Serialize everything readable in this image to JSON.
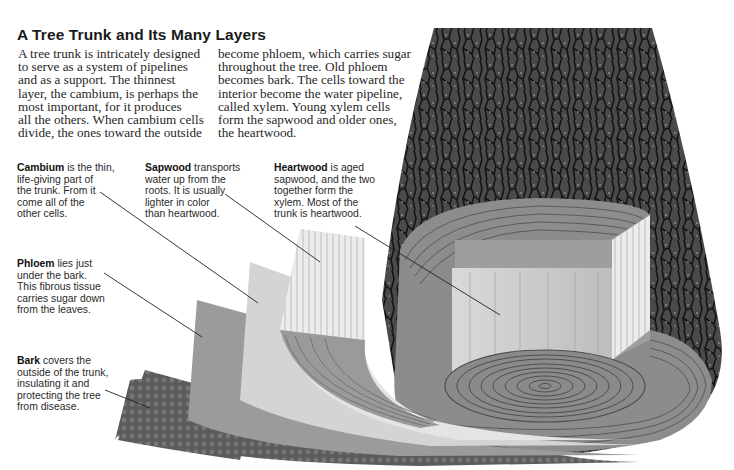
{
  "title": "A Tree Trunk and Its Many Layers",
  "intro": {
    "column1": [
      "A tree trunk is intricately designed",
      "to serve as a system of pipelines",
      "and as a support. The thinnest",
      "layer, the cambium, is perhaps the",
      "most important, for it produces",
      "all the others. When cambium cells",
      "divide, the ones toward the outside"
    ],
    "column2": [
      "become phloem, which carries sugar",
      "throughout the tree. Old phloem",
      "becomes bark. The cells toward the",
      "interior become the water pipeline,",
      "called xylem. Young xylem cells",
      "form the sapwood and older ones,",
      "the heartwood."
    ]
  },
  "labels": {
    "cambium": {
      "term": "Cambium",
      "lines": [
        " is the thin,",
        "life-giving part of",
        "the trunk. From it",
        "come all of the",
        "other cells."
      ]
    },
    "sapwood": {
      "term": "Sapwood",
      "lines": [
        " transports",
        "water up from the",
        "roots. It is usually",
        "lighter in color",
        "than heartwood."
      ]
    },
    "heartwood": {
      "term": "Heartwood",
      "lines": [
        " is aged",
        "sapwood, and the two",
        "together form the",
        "xylem. Most of the",
        "trunk is heartwood."
      ]
    },
    "phloem": {
      "term": "Phloem",
      "lines": [
        " lies just",
        "under the bark.",
        "This fibrous tissue",
        "carries sugar down",
        "from the leaves."
      ]
    },
    "bark": {
      "term": "Bark",
      "lines": [
        " covers the",
        "outside of the trunk,",
        "insulating it and",
        "protecting the tree",
        "from disease."
      ]
    }
  },
  "colors": {
    "bark_dark": "#3a3a3a",
    "bark_mid": "#6b6b6b",
    "phloem": "#9a9a9a",
    "cambium": "#d0d0d0",
    "sapwood": "#e6e6e6",
    "heartwood": "#c8c8c8",
    "rings": "#555555"
  }
}
